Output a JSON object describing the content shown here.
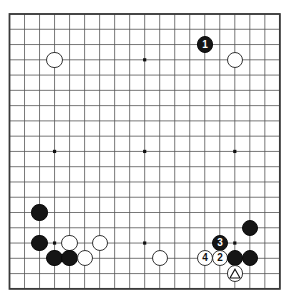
{
  "diagram": {
    "type": "go-board-diagram",
    "board_size": 19,
    "background_color": "#ffffff",
    "grid_line_color": "#555555",
    "border_color": "#3a3a3a",
    "black_stone_color": "#151515",
    "white_stone_color": "#ffffff",
    "star_points": [
      {
        "col": 3,
        "row": 3
      },
      {
        "col": 9,
        "row": 3
      },
      {
        "col": 15,
        "row": 3
      },
      {
        "col": 3,
        "row": 9
      },
      {
        "col": 9,
        "row": 9
      },
      {
        "col": 15,
        "row": 9
      },
      {
        "col": 3,
        "row": 15
      },
      {
        "col": 9,
        "row": 15
      },
      {
        "col": 15,
        "row": 15
      }
    ],
    "stones": [
      {
        "col": 13,
        "row": 2,
        "color": "black",
        "label": "1",
        "name": "move-1-black"
      },
      {
        "col": 15,
        "row": 3,
        "color": "white",
        "label": "",
        "name": "white-stone-r3c15"
      },
      {
        "col": 3,
        "row": 3,
        "color": "white",
        "label": "",
        "name": "white-stone-r3c3"
      },
      {
        "col": 2,
        "row": 13,
        "color": "black",
        "label": "",
        "name": "black-stone-r13c2"
      },
      {
        "col": 2,
        "row": 15,
        "color": "black",
        "label": "",
        "name": "black-stone-r15c2"
      },
      {
        "col": 4,
        "row": 15,
        "color": "white",
        "label": "",
        "name": "white-stone-r15c4"
      },
      {
        "col": 6,
        "row": 15,
        "color": "white",
        "label": "",
        "name": "white-stone-r15c6"
      },
      {
        "col": 3,
        "row": 16,
        "color": "black",
        "label": "",
        "name": "black-stone-r16c3"
      },
      {
        "col": 4,
        "row": 16,
        "color": "black",
        "label": "",
        "name": "black-stone-r16c4"
      },
      {
        "col": 5,
        "row": 16,
        "color": "white",
        "label": "",
        "name": "white-stone-r16c5"
      },
      {
        "col": 10,
        "row": 16,
        "color": "white",
        "label": "",
        "name": "white-stone-r16c10"
      },
      {
        "col": 16,
        "row": 14,
        "color": "black",
        "label": "",
        "name": "black-stone-r14c16"
      },
      {
        "col": 14,
        "row": 15,
        "color": "black",
        "label": "3",
        "name": "move-3-black"
      },
      {
        "col": 13,
        "row": 16,
        "color": "white",
        "label": "4",
        "name": "move-4-white"
      },
      {
        "col": 14,
        "row": 16,
        "color": "white",
        "label": "2",
        "name": "move-2-white"
      },
      {
        "col": 15,
        "row": 16,
        "color": "black",
        "label": "",
        "name": "black-stone-r16c15"
      },
      {
        "col": 16,
        "row": 16,
        "color": "black",
        "label": "",
        "name": "black-stone-r16c16"
      },
      {
        "col": 15,
        "row": 17,
        "color": "white",
        "label": "",
        "name": "white-stone-marked-triangle"
      }
    ],
    "markers": [
      {
        "col": 15,
        "row": 17,
        "shape": "triangle",
        "on": "white",
        "name": "triangle-marker"
      }
    ],
    "move_numbers": [
      "1",
      "2",
      "3",
      "4"
    ]
  }
}
